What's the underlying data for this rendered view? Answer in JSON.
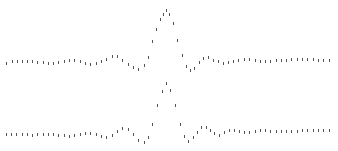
{
  "chart_data": [
    {
      "type": "scatter",
      "title": "",
      "xlabel": "",
      "ylabel": "",
      "grid": false,
      "marker": "short vertical tick",
      "color": "#555555",
      "description": "Damped oscillation (sinc-like) centered peak, upper trace",
      "points": [
        [
          6,
          63
        ],
        [
          12,
          61
        ],
        [
          17,
          61
        ],
        [
          22,
          61
        ],
        [
          27,
          61
        ],
        [
          32,
          61
        ],
        [
          37,
          62
        ],
        [
          43,
          62
        ],
        [
          48,
          63
        ],
        [
          53,
          63
        ],
        [
          58,
          62
        ],
        [
          64,
          61
        ],
        [
          69,
          60
        ],
        [
          74,
          60
        ],
        [
          80,
          61
        ],
        [
          85,
          63
        ],
        [
          90,
          64
        ],
        [
          96,
          63
        ],
        [
          101,
          61
        ],
        [
          106,
          59
        ],
        [
          112,
          56
        ],
        [
          117,
          56
        ],
        [
          122,
          60
        ],
        [
          128,
          64
        ],
        [
          133,
          67
        ],
        [
          138,
          69
        ],
        [
          144,
          65
        ],
        [
          148,
          57
        ],
        [
          152,
          41
        ],
        [
          156,
          29
        ],
        [
          160,
          19
        ],
        [
          163,
          14
        ],
        [
          166,
          10
        ],
        [
          169,
          14
        ],
        [
          173,
          23
        ],
        [
          177,
          40
        ],
        [
          182,
          55
        ],
        [
          186,
          66
        ],
        [
          190,
          70
        ],
        [
          194,
          68
        ],
        [
          199,
          62
        ],
        [
          203,
          58
        ],
        [
          208,
          57
        ],
        [
          213,
          60
        ],
        [
          218,
          61
        ],
        [
          223,
          63
        ],
        [
          228,
          62
        ],
        [
          233,
          61
        ],
        [
          238,
          60
        ],
        [
          244,
          59
        ],
        [
          249,
          59
        ],
        [
          255,
          60
        ],
        [
          260,
          61
        ],
        [
          265,
          61
        ],
        [
          270,
          61
        ],
        [
          276,
          60
        ],
        [
          281,
          60
        ],
        [
          286,
          60
        ],
        [
          291,
          59
        ],
        [
          297,
          59
        ],
        [
          302,
          59
        ],
        [
          307,
          59
        ],
        [
          313,
          59
        ],
        [
          318,
          60
        ],
        [
          323,
          60
        ],
        [
          329,
          60
        ]
      ]
    },
    {
      "type": "scatter",
      "title": "",
      "xlabel": "",
      "ylabel": "",
      "grid": false,
      "marker": "short vertical tick",
      "color": "#555555",
      "description": "Damped oscillation (sinc-like) centered peak, lower trace",
      "points": [
        [
          6,
          134
        ],
        [
          11,
          134
        ],
        [
          16,
          134
        ],
        [
          22,
          134
        ],
        [
          27,
          134
        ],
        [
          32,
          135
        ],
        [
          37,
          134
        ],
        [
          43,
          134
        ],
        [
          48,
          134
        ],
        [
          53,
          134
        ],
        [
          58,
          135
        ],
        [
          64,
          135
        ],
        [
          69,
          136
        ],
        [
          74,
          135
        ],
        [
          80,
          134
        ],
        [
          85,
          133
        ],
        [
          90,
          133
        ],
        [
          96,
          134
        ],
        [
          101,
          136
        ],
        [
          106,
          137
        ],
        [
          112,
          135
        ],
        [
          117,
          131
        ],
        [
          122,
          128
        ],
        [
          128,
          129
        ],
        [
          133,
          134
        ],
        [
          138,
          140
        ],
        [
          144,
          142
        ],
        [
          148,
          137
        ],
        [
          152,
          124
        ],
        [
          157,
          105
        ],
        [
          162,
          91
        ],
        [
          166,
          83
        ],
        [
          170,
          90
        ],
        [
          175,
          105
        ],
        [
          180,
          124
        ],
        [
          184,
          136
        ],
        [
          188,
          141
        ],
        [
          193,
          137
        ],
        [
          197,
          132
        ],
        [
          201,
          127
        ],
        [
          206,
          127
        ],
        [
          210,
          130
        ],
        [
          214,
          133
        ],
        [
          219,
          135
        ],
        [
          224,
          132
        ],
        [
          229,
          130
        ],
        [
          234,
          130
        ],
        [
          239,
          131
        ],
        [
          244,
          132
        ],
        [
          249,
          132
        ],
        [
          255,
          131
        ],
        [
          260,
          130
        ],
        [
          265,
          130
        ],
        [
          270,
          131
        ],
        [
          276,
          131
        ],
        [
          281,
          131
        ],
        [
          286,
          131
        ],
        [
          291,
          131
        ],
        [
          297,
          131
        ],
        [
          302,
          130
        ],
        [
          307,
          130
        ],
        [
          313,
          130
        ],
        [
          318,
          130
        ],
        [
          323,
          130
        ],
        [
          329,
          130
        ]
      ]
    }
  ]
}
